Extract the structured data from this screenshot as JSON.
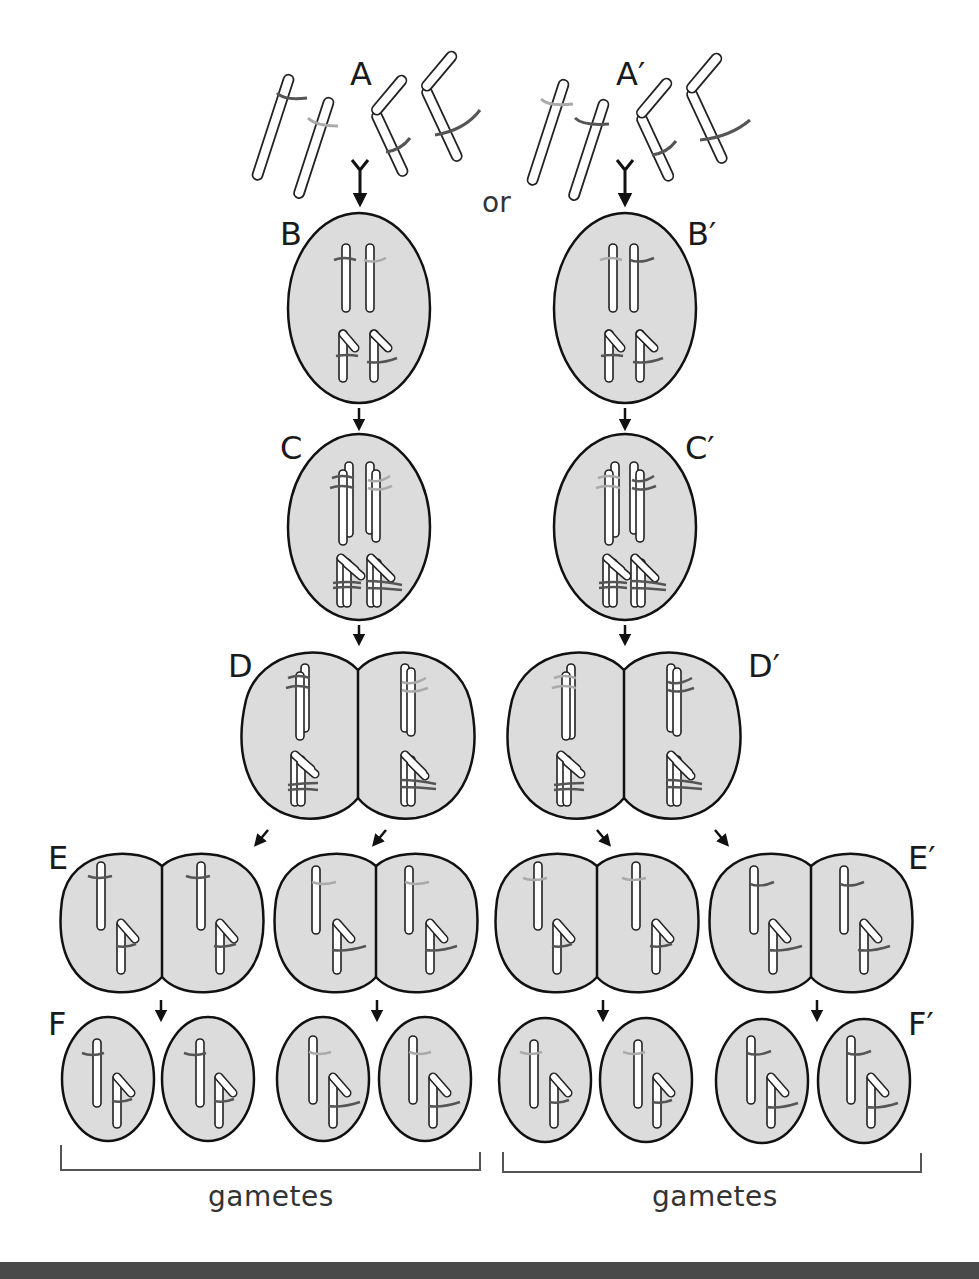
{
  "diagram": {
    "type": "meiosis-segregation",
    "connector_text": "or",
    "left_pathway": {
      "stages": [
        {
          "id": "A",
          "label": "A",
          "description": "unpaired chromosomes"
        },
        {
          "id": "B",
          "label": "B",
          "description": "cell with homologous chromosomes"
        },
        {
          "id": "C",
          "label": "C",
          "description": "replicated chromosomes"
        },
        {
          "id": "D",
          "label": "D",
          "description": "first division"
        },
        {
          "id": "E",
          "label": "E",
          "description": "second division"
        },
        {
          "id": "F",
          "label": "F",
          "description": "four gamete cells"
        }
      ],
      "bracket_label": "gametes"
    },
    "right_pathway": {
      "stages": [
        {
          "id": "A2",
          "label": "A′",
          "description": "unpaired chromosomes"
        },
        {
          "id": "B2",
          "label": "B′",
          "description": "cell with homologous chromosomes"
        },
        {
          "id": "C2",
          "label": "C′",
          "description": "replicated chromosomes"
        },
        {
          "id": "D2",
          "label": "D′",
          "description": "first division"
        },
        {
          "id": "E2",
          "label": "E′",
          "description": "second division"
        },
        {
          "id": "F2",
          "label": "F′",
          "description": "four gamete cells"
        }
      ],
      "bracket_label": "gametes"
    },
    "colors": {
      "cell_fill": "#dcdcdc",
      "cell_stroke": "#111111",
      "chromosome_fill": "#ffffff",
      "gene_dark": "#555555",
      "gene_light": "#aaaaaa",
      "footer_band": "#4a4a4a"
    }
  }
}
